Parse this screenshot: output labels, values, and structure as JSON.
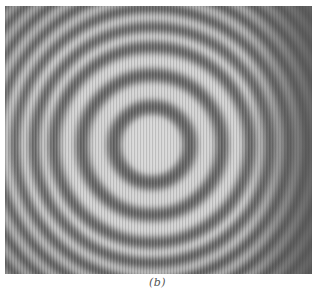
{
  "figure": {
    "label": "(b)",
    "pattern": {
      "center": [
        147,
        139
      ],
      "dark_ring_radii": [
        38,
        70,
        98,
        118,
        137,
        155,
        172,
        188,
        203,
        218
      ],
      "colors": {
        "bright": "#d9d9d9",
        "dark": "#5a5a5a",
        "edge_shade": "#6e6e6e"
      }
    }
  }
}
